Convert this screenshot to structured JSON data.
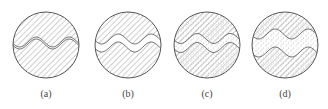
{
  "figure": {
    "panels": [
      {
        "id": "a",
        "label": "(a)",
        "cx": 46,
        "cy": 45,
        "fill": "none",
        "gap": 0
      },
      {
        "id": "b",
        "label": "(b)",
        "cx": 128,
        "cy": 45,
        "fill": "none",
        "gap": 6
      },
      {
        "id": "c",
        "label": "(c)",
        "cx": 207,
        "cy": 45,
        "fill": "dotted",
        "gap": 7
      },
      {
        "id": "d",
        "label": "(d)",
        "cx": 285,
        "cy": 45,
        "fill": "dotted",
        "gap": 16
      }
    ],
    "radius": 33,
    "colors": {
      "line": "#555555",
      "hatch": "#888888",
      "dots": "#777777"
    }
  }
}
